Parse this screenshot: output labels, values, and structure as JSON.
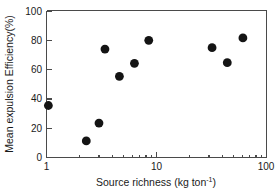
{
  "chart_data": {
    "type": "scatter",
    "title": "",
    "xlabel": "Source richness (kg ton-1)",
    "xlabel_main": "Source richness (kg ton",
    "xlabel_sup": "-1",
    "xlabel_tail": ")",
    "ylabel": "Mean expulsion Efficiency(%)",
    "xscale": "log",
    "yscale": "linear",
    "xlim": [
      1,
      100
    ],
    "ylim": [
      0,
      100
    ],
    "grid": false,
    "legend": null,
    "xticks": [
      1,
      10,
      100
    ],
    "xtick_labels": [
      "1",
      "10",
      "100"
    ],
    "yticks": [
      0,
      20,
      40,
      60,
      80,
      100
    ],
    "ytick_labels": [
      "0",
      "20",
      "40",
      "60",
      "80",
      "100"
    ],
    "marker": "filled-circle",
    "marker_color": "#141414",
    "marker_size": 4.4,
    "points": [
      {
        "x": 1.04,
        "y": 35.5
      },
      {
        "x": 2.3,
        "y": 11.3
      },
      {
        "x": 3.0,
        "y": 23.5
      },
      {
        "x": 3.4,
        "y": 74.0
      },
      {
        "x": 4.6,
        "y": 55.4
      },
      {
        "x": 6.3,
        "y": 64.3
      },
      {
        "x": 8.5,
        "y": 80.0
      },
      {
        "x": 32.0,
        "y": 75.0
      },
      {
        "x": 44.0,
        "y": 64.7
      },
      {
        "x": 61.0,
        "y": 81.6
      }
    ],
    "series": [
      {
        "name": "Expulsion efficiency vs source richness",
        "x": [
          1.04,
          2.3,
          3.0,
          3.4,
          4.6,
          6.3,
          8.5,
          32.0,
          44.0,
          61.0
        ],
        "values": [
          35.5,
          11.3,
          23.5,
          74.0,
          55.4,
          64.3,
          80.0,
          75.0,
          64.7,
          81.6
        ]
      }
    ]
  },
  "figure": {
    "background_color": "#ffffff",
    "axis_color": "#4a4a4a",
    "text_color": "#1a1a1a"
  }
}
